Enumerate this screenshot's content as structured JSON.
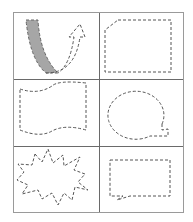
{
  "colors": {
    "border": "#9a9a9a",
    "stroke": "#555555",
    "fill": "#a6a6a6"
  },
  "cells": [
    {
      "id": "curved-arrow",
      "label": "U-turn curved arrow with shaded left band"
    },
    {
      "id": "snipped-rectangle",
      "label": "Rectangle with snipped top-left corner"
    },
    {
      "id": "wave-banner",
      "label": "Double wave flag"
    },
    {
      "id": "round-callout",
      "label": "Oval speech callout"
    },
    {
      "id": "explosion",
      "label": "Explosion starburst"
    },
    {
      "id": "rect-callout",
      "label": "Rectangular speech callout"
    }
  ]
}
